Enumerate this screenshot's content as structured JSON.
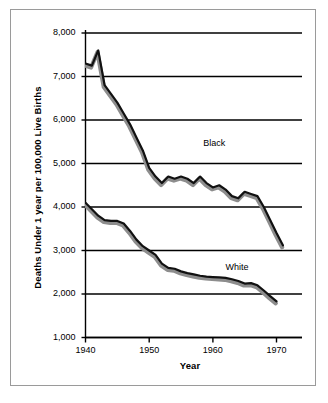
{
  "figure": {
    "ylabel": "Deaths Under 1 year per 100,000 Live Births",
    "xlabel": "Year"
  },
  "chart_data": {
    "type": "line",
    "title": "",
    "xlabel": "Year",
    "ylabel": "Deaths Under 1 year per 100,000 Live Births",
    "xlim": [
      1940,
      1974
    ],
    "ylim": [
      1000,
      8000
    ],
    "xticks": [
      1940,
      1950,
      1960,
      1970
    ],
    "xtick_labels": [
      "1940",
      "1950",
      "1960",
      "1970"
    ],
    "yticks": [
      1000,
      2000,
      3000,
      4000,
      5000,
      6000,
      7000,
      8000
    ],
    "ytick_labels": [
      "1,000",
      "2,000",
      "3,000",
      "4,000",
      "5,000",
      "6,000",
      "7,000",
      "8,000"
    ],
    "grid": "horizontal",
    "legend": "inline-annotations",
    "series": [
      {
        "name": "Black",
        "label_position": {
          "x": 1958.5,
          "y": 5450
        },
        "x": [
          1940,
          1941,
          1942,
          1943,
          1944,
          1945,
          1946,
          1947,
          1948,
          1949,
          1950,
          1951,
          1952,
          1953,
          1954,
          1955,
          1956,
          1957,
          1958,
          1959,
          1960,
          1961,
          1962,
          1963,
          1964,
          1965,
          1966,
          1967,
          1968,
          1969,
          1970,
          1971
        ],
        "values": [
          7300,
          7250,
          7600,
          6800,
          6600,
          6400,
          6150,
          5900,
          5600,
          5300,
          4900,
          4700,
          4550,
          4700,
          4650,
          4700,
          4650,
          4550,
          4700,
          4550,
          4450,
          4500,
          4400,
          4250,
          4200,
          4350,
          4300,
          4250,
          4000,
          3700,
          3400,
          3120
        ]
      },
      {
        "name": "White",
        "label_position": {
          "x": 1962,
          "y": 2600
        },
        "x": [
          1940,
          1941,
          1942,
          1943,
          1944,
          1945,
          1946,
          1947,
          1948,
          1949,
          1950,
          1951,
          1952,
          1953,
          1954,
          1955,
          1956,
          1957,
          1958,
          1959,
          1960,
          1961,
          1962,
          1963,
          1964,
          1965,
          1966,
          1967,
          1968,
          1969,
          1970
        ],
        "values": [
          4100,
          3950,
          3800,
          3700,
          3680,
          3680,
          3620,
          3450,
          3250,
          3100,
          3000,
          2900,
          2700,
          2600,
          2580,
          2520,
          2480,
          2450,
          2420,
          2400,
          2390,
          2380,
          2370,
          2340,
          2300,
          2240,
          2250,
          2200,
          2080,
          1950,
          1830
        ]
      }
    ]
  }
}
